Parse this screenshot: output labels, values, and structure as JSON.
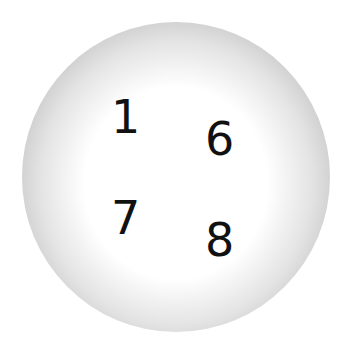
{
  "figure": {
    "shape": "sphere",
    "numbers": [
      {
        "label": "1"
      },
      {
        "label": "6"
      },
      {
        "label": "7"
      },
      {
        "label": "8"
      }
    ]
  },
  "colors": {
    "center": "#ffffff",
    "edge": "#a9a9a9",
    "text": "#111111"
  }
}
